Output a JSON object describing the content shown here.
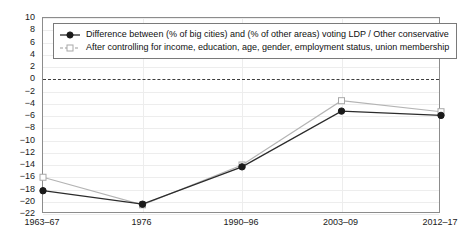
{
  "chart_data": {
    "type": "line",
    "title": "",
    "subtitle": "",
    "xlabel": "",
    "ylabel": "",
    "categories": [
      "1963–67",
      "1976",
      "1990–96",
      "2003–09",
      "2012–17"
    ],
    "ylim": [
      -22,
      10
    ],
    "yticks": [
      10,
      8,
      6,
      4,
      2,
      0,
      -2,
      -4,
      -6,
      -8,
      -10,
      -12,
      -14,
      -16,
      -18,
      -20,
      -22
    ],
    "ytick_labels": [
      "10",
      "8",
      "6",
      "4",
      "2",
      "0",
      "−2",
      "−4",
      "−6",
      "−8",
      "−10",
      "−12",
      "−14",
      "−16",
      "−18",
      "−20",
      "−22"
    ],
    "grid": true,
    "zero_line": 0,
    "legend_position": "top-left",
    "series": [
      {
        "name": "Difference between (% of big cities) and (% of other areas) voting LDP / Other conservative",
        "values": [
          -18.2,
          -20.4,
          -14.3,
          -5.2,
          -5.9
        ],
        "color": "#2b2b2b",
        "marker": "filled-circle",
        "line_style": "solid"
      },
      {
        "name": "After controlling for income, education, age, gender, employment status, union membership",
        "values": [
          -16.0,
          -20.5,
          -14.0,
          -3.5,
          -5.3
        ],
        "color": "#b4b4b4",
        "marker": "open-square",
        "line_style": "solid-light"
      }
    ]
  },
  "legend": {
    "items": [
      {
        "label": "Difference between (% of big cities) and (% of other areas) voting LDP / Other conservative"
      },
      {
        "label": "After controlling for income, education, age, gender, employment status, union membership"
      }
    ]
  }
}
